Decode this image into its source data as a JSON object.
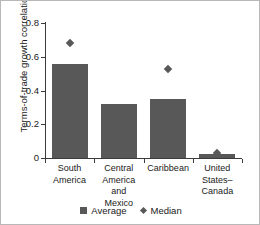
{
  "chart_data": {
    "type": "bar",
    "title": "",
    "xlabel": "",
    "ylabel": "Terms-of-trade growth correlation",
    "ylim": [
      0,
      0.8
    ],
    "yticks": [
      "0",
      "0.2",
      "0.4",
      "0.6",
      "0.8"
    ],
    "ytick_values": [
      0,
      0.2,
      0.4,
      0.6,
      0.8
    ],
    "grid": false,
    "legend_position": "bottom",
    "categories": [
      "South\nAmerica",
      "Central\nAmerica and\nMexico",
      "Caribbean",
      "United\nStates–\nCanada"
    ],
    "category_lines": [
      [
        "South",
        "America"
      ],
      [
        "Central",
        "America and",
        "Mexico"
      ],
      [
        "Caribbean"
      ],
      [
        "United",
        "States–",
        "Canada"
      ]
    ],
    "series": [
      {
        "name": "Average",
        "marker": "square",
        "values": [
          0.56,
          0.32,
          0.35,
          0.025
        ]
      },
      {
        "name": "Median",
        "marker": "diamond",
        "values": [
          0.68,
          null,
          0.53,
          0.03
        ]
      }
    ]
  },
  "legend": {
    "items": [
      {
        "label": "Average",
        "marker": "square-marker"
      },
      {
        "label": "Median",
        "marker": "diamond-marker"
      }
    ]
  },
  "colors": {
    "bar": "#585858",
    "marker": "#585858",
    "axis": "#3b3b3b",
    "text": "#1a1a1a",
    "background": "#ffffff",
    "frame": "#b8b8b8"
  }
}
